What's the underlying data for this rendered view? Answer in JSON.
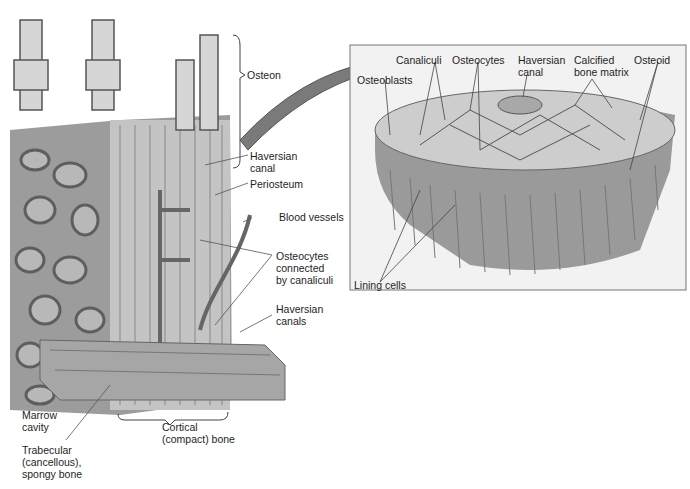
{
  "figure": {
    "left_panel": {
      "labels": {
        "osteon": "Osteon",
        "haversian_canal": "Haversian\ncanal",
        "periosteum": "Periosteum",
        "blood_vessels": "Blood vessels",
        "osteocytes_connected": "Osteocytes\nconnected\nby canaliculi",
        "haversian_canals": "Haversian\ncanals",
        "marrow_cavity": "Marrow\ncavity",
        "trabecular": "Trabecular\n(cancellous),\nspongy bone",
        "cortical": "Cortical\n(compact) bone"
      }
    },
    "inset_panel": {
      "labels": {
        "osteoblasts": "Osteoblasts",
        "canaliculi": "Canaliculi",
        "osteocytes": "Osteocytes",
        "haversian_canal": "Haversian\ncanal",
        "calcified_matrix": "Calcified\nbone matrix",
        "osteoid": "Osteoid",
        "lining_cells": "Lining cells"
      }
    },
    "colors": {
      "bone": "#9a9a9a",
      "bone_light": "#cfcfcf",
      "bone_dark": "#6e6e6e",
      "marrow": "#8a8a8a",
      "inset_bg": "#f2f2f2",
      "inset_border": "#777777"
    }
  }
}
